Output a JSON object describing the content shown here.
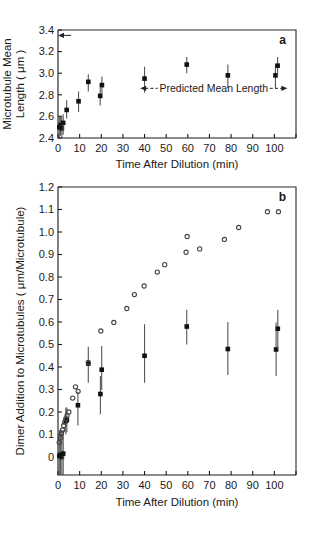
{
  "figure": {
    "panel_a_letter": "a",
    "panel_b_letter": "b"
  },
  "chart_data": [
    {
      "id": "panel-a",
      "type": "scatter",
      "title": "",
      "panel_label": "a",
      "xlabel": "Time After Dilution (min)",
      "ylabel_line1": "Microtubule Mean",
      "ylabel_line2": "Length ( μm )",
      "xlim": [
        0,
        110
      ],
      "ylim": [
        2.4,
        3.4
      ],
      "xticks": [
        0,
        10,
        20,
        30,
        40,
        50,
        60,
        70,
        80,
        90,
        100
      ],
      "xtick_labels": [
        "0",
        "10",
        "20",
        "30",
        "40",
        "50",
        "60",
        "70",
        "80",
        "90",
        "100"
      ],
      "yticks": [
        2.4,
        2.6,
        2.8,
        3.0,
        3.2,
        3.4
      ],
      "ytick_labels": [
        "2.4",
        "2.6",
        "2.8",
        "3.0",
        "3.2",
        "3.4"
      ],
      "grid": false,
      "legend": "none",
      "series": [
        {
          "name": "Microtubule mean length",
          "marker": "filled-square",
          "points": [
            {
              "x": 0.6,
              "y": 2.5,
              "yerr_low": 0.1,
              "yerr_high": 0.1
            },
            {
              "x": 1.2,
              "y": 2.52,
              "yerr_low": 0.1,
              "yerr_high": 0.09
            },
            {
              "x": 1.8,
              "y": 2.49,
              "yerr_low": 0.09,
              "yerr_high": 0.11
            },
            {
              "x": 2.4,
              "y": 2.54,
              "yerr_low": 0.11,
              "yerr_high": 0.08
            },
            {
              "x": 4.0,
              "y": 2.66,
              "yerr_low": 0.08,
              "yerr_high": 0.09
            },
            {
              "x": 9.5,
              "y": 2.74,
              "yerr_low": 0.1,
              "yerr_high": 0.09
            },
            {
              "x": 14.0,
              "y": 2.92,
              "yerr_low": 0.09,
              "yerr_high": 0.07
            },
            {
              "x": 19.5,
              "y": 2.79,
              "yerr_low": 0.09,
              "yerr_high": 0.08
            },
            {
              "x": 20.3,
              "y": 2.89,
              "yerr_low": 0.09,
              "yerr_high": 0.08
            },
            {
              "x": 40.0,
              "y": 2.95,
              "yerr_low": 0.13,
              "yerr_high": 0.11
            },
            {
              "x": 59.5,
              "y": 3.08,
              "yerr_low": 0.08,
              "yerr_high": 0.07
            },
            {
              "x": 78.5,
              "y": 2.98,
              "yerr_low": 0.12,
              "yerr_high": 0.1
            },
            {
              "x": 100.5,
              "y": 2.98,
              "yerr_low": 0.12,
              "yerr_high": 0.1
            },
            {
              "x": 101.5,
              "y": 3.07,
              "yerr_low": 0.09,
              "yerr_high": 0.08
            }
          ]
        }
      ],
      "annotations": [
        {
          "name": "predicted-mean-length",
          "text": "Predicted Mean Length",
          "y": 2.86,
          "x_start": 38,
          "x_end": 106,
          "style": "double-arrow-dashed"
        },
        {
          "name": "initial-length-arrow",
          "text": "",
          "y": 3.35,
          "x_start": 0,
          "x_end": 6,
          "style": "left-arrow"
        }
      ]
    },
    {
      "id": "panel-b",
      "type": "scatter",
      "title": "",
      "panel_label": "b",
      "xlabel": "Time After Dilution (min)",
      "ylabel": "Dimer Addition to Microtubules ( μm/Microtubule)",
      "xlim": [
        0,
        110
      ],
      "ylim": [
        -0.08,
        1.2
      ],
      "xticks": [
        0,
        10,
        20,
        30,
        40,
        50,
        60,
        70,
        80,
        90,
        100
      ],
      "xtick_labels": [
        "0",
        "10",
        "20",
        "30",
        "40",
        "50",
        "60",
        "70",
        "80",
        "90",
        "100"
      ],
      "yticks": [
        0,
        0.1,
        0.2,
        0.3,
        0.4,
        0.5,
        0.6,
        0.7,
        0.8,
        0.9,
        1.0,
        1.1,
        1.2
      ],
      "ytick_labels": [
        "0",
        "0.1",
        "0.2",
        "0.3",
        "0.4",
        "0.5",
        "0.6",
        "0.7",
        "0.8",
        "0.9",
        "1.0",
        "1.1",
        "1.2"
      ],
      "grid": false,
      "legend": "none",
      "series": [
        {
          "name": "Measured dimer addition",
          "marker": "filled-square",
          "points": [
            {
              "x": 0.6,
              "y": 0.005,
              "yerr_low": 0.085,
              "yerr_high": 0.115
            },
            {
              "x": 1.2,
              "y": 0.01,
              "yerr_low": 0.09,
              "yerr_high": 0.11
            },
            {
              "x": 1.8,
              "y": 0.0,
              "yerr_low": 0.08,
              "yerr_high": 0.12
            },
            {
              "x": 2.4,
              "y": 0.015,
              "yerr_low": 0.095,
              "yerr_high": 0.105
            },
            {
              "x": 3.6,
              "y": 0.16,
              "yerr_low": 0.06,
              "yerr_high": 0.06
            },
            {
              "x": 4.1,
              "y": 0.165,
              "yerr_low": 0.055,
              "yerr_high": 0.055
            },
            {
              "x": 9.2,
              "y": 0.23,
              "yerr_low": 0.09,
              "yerr_high": 0.06
            },
            {
              "x": 14.0,
              "y": 0.415,
              "yerr_low": 0.085,
              "yerr_high": 0.075
            },
            {
              "x": 19.6,
              "y": 0.28,
              "yerr_low": 0.09,
              "yerr_high": 0.08
            },
            {
              "x": 20.2,
              "y": 0.388,
              "yerr_low": 0.09,
              "yerr_high": 0.105
            },
            {
              "x": 40.0,
              "y": 0.45,
              "yerr_low": 0.12,
              "yerr_high": 0.14
            },
            {
              "x": 59.5,
              "y": 0.58,
              "yerr_low": 0.08,
              "yerr_high": 0.075
            },
            {
              "x": 78.5,
              "y": 0.48,
              "yerr_low": 0.115,
              "yerr_high": 0.12
            },
            {
              "x": 100.8,
              "y": 0.478,
              "yerr_low": 0.118,
              "yerr_high": 0.12
            },
            {
              "x": 101.6,
              "y": 0.57,
              "yerr_low": 0.09,
              "yerr_high": 0.085
            }
          ]
        },
        {
          "name": "Predicted dimer addition",
          "marker": "open-circle",
          "points": [
            {
              "x": 0.6,
              "y": 0.065
            },
            {
              "x": 1.1,
              "y": 0.085
            },
            {
              "x": 1.6,
              "y": 0.105
            },
            {
              "x": 2.1,
              "y": 0.12
            },
            {
              "x": 2.6,
              "y": 0.14
            },
            {
              "x": 3.1,
              "y": 0.155
            },
            {
              "x": 3.6,
              "y": 0.17
            },
            {
              "x": 4.2,
              "y": 0.185
            },
            {
              "x": 5.0,
              "y": 0.2
            },
            {
              "x": 6.8,
              "y": 0.262
            },
            {
              "x": 8.1,
              "y": 0.312
            },
            {
              "x": 9.3,
              "y": 0.292
            },
            {
              "x": 14.0,
              "y": 0.42
            },
            {
              "x": 19.8,
              "y": 0.56
            },
            {
              "x": 25.8,
              "y": 0.598
            },
            {
              "x": 31.8,
              "y": 0.66
            },
            {
              "x": 35.3,
              "y": 0.722
            },
            {
              "x": 39.8,
              "y": 0.76
            },
            {
              "x": 45.9,
              "y": 0.822
            },
            {
              "x": 49.3,
              "y": 0.855
            },
            {
              "x": 59.2,
              "y": 0.91
            },
            {
              "x": 59.7,
              "y": 0.98
            },
            {
              "x": 65.5,
              "y": 0.925
            },
            {
              "x": 76.9,
              "y": 0.967
            },
            {
              "x": 83.5,
              "y": 1.02
            },
            {
              "x": 96.8,
              "y": 1.09
            },
            {
              "x": 101.9,
              "y": 1.09
            }
          ]
        }
      ],
      "annotations": []
    }
  ]
}
